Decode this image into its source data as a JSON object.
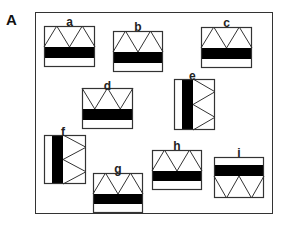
{
  "panel": {
    "label": "A"
  },
  "colors": {
    "stroke": "#333333",
    "band": "#000000",
    "background": "#ffffff"
  },
  "tiles": [
    {
      "id": "a",
      "label": "a",
      "x": 44,
      "y": 26,
      "w": 51,
      "h": 41,
      "orientation": "up"
    },
    {
      "id": "b",
      "label": "b",
      "x": 113,
      "y": 31,
      "w": 50,
      "h": 41,
      "orientation": "up"
    },
    {
      "id": "c",
      "label": "c",
      "x": 201,
      "y": 27,
      "w": 51,
      "h": 41,
      "orientation": "up"
    },
    {
      "id": "d",
      "label": "d",
      "x": 82,
      "y": 88,
      "w": 51,
      "h": 41,
      "orientation": "down-top"
    },
    {
      "id": "e",
      "label": "e",
      "x": 174,
      "y": 79,
      "w": 41,
      "h": 51,
      "orientation": "right"
    },
    {
      "id": "f",
      "label": "f",
      "x": 44,
      "y": 135,
      "w": 42,
      "h": 49,
      "orientation": "right"
    },
    {
      "id": "g",
      "label": "g",
      "x": 93,
      "y": 173,
      "w": 50,
      "h": 40,
      "orientation": "up"
    },
    {
      "id": "h",
      "label": "h",
      "x": 152,
      "y": 150,
      "w": 50,
      "h": 40,
      "orientation": "up"
    },
    {
      "id": "i",
      "label": "i",
      "x": 214,
      "y": 157,
      "w": 50,
      "h": 41,
      "orientation": "down"
    }
  ]
}
